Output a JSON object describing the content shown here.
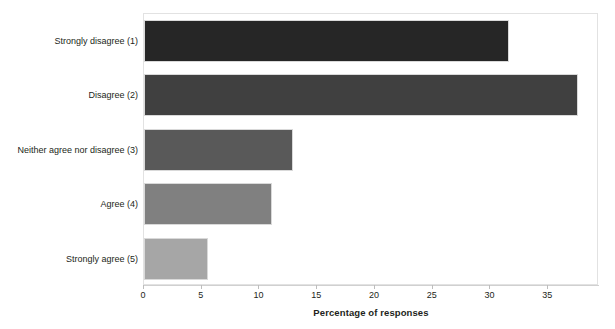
{
  "chart_data": {
    "type": "bar",
    "orientation": "horizontal",
    "title": "",
    "xlabel": "Percentage of responses",
    "ylabel": "",
    "categories": [
      "Strongly disagree (1)",
      "Disagree (2)",
      "Neither agree nor disagree (3)",
      "Agree (4)",
      "Strongly agree (5)"
    ],
    "values": [
      31.6,
      37.6,
      12.9,
      11.1,
      5.5
    ],
    "bar_colors": [
      "#262626",
      "#404040",
      "#595959",
      "#808080",
      "#a6a6a6"
    ],
    "xlim": [
      0,
      39.4
    ],
    "xticks": [
      0,
      5,
      10,
      15,
      20,
      25,
      30,
      35
    ],
    "xtick_labels": [
      "0",
      "5",
      "10",
      "15",
      "20",
      "25",
      "30",
      "35"
    ],
    "grid": false,
    "legend": false
  }
}
